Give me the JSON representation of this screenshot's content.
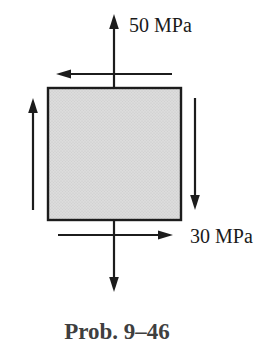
{
  "figure": {
    "type": "stress-element-diagram",
    "caption": "Prob. 9–46",
    "labels": {
      "normal_stress": "50 MPa",
      "shear_stress": "30 MPa"
    },
    "arrows": {
      "top_normal": "up",
      "bottom_normal": "down",
      "top_shear": "left",
      "bottom_shear": "right",
      "left_shear": "up",
      "right_shear": "down"
    },
    "colors": {
      "line": "#1c1c1c",
      "square_border": "#1c1c1c",
      "square_fill": "#dcdcdc",
      "square_dot": "#c6c6c6",
      "label_color": "#1a1a1a",
      "caption_color": "#3f3f3f",
      "background": "#ffffff"
    }
  }
}
